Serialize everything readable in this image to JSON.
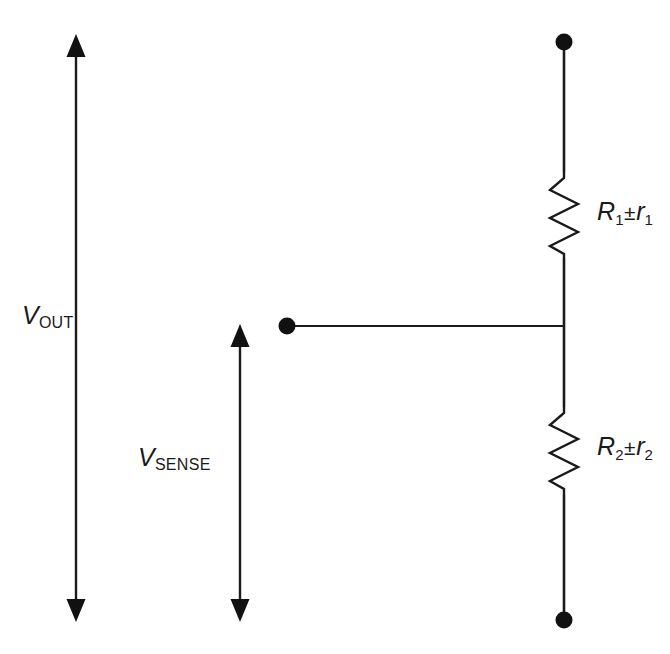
{
  "figure": {
    "kind": "electronic-schematic",
    "background_color": "#ffffff",
    "ink_color": "#1a1a1a",
    "width": 670,
    "height": 654
  },
  "labels": {
    "vout": {
      "symbol": "V",
      "subscript": "OUT",
      "full_text": "VOUT"
    },
    "vsense": {
      "symbol": "V",
      "subscript": "SENSE",
      "full_text": "VSENSE"
    },
    "r1": {
      "symbol": "R",
      "subscript": "1",
      "operator": "±",
      "tolerance_symbol": "r",
      "tolerance_subscript": "1",
      "full_text": "R1±r1"
    },
    "r2": {
      "symbol": "R",
      "subscript": "2",
      "operator": "±",
      "tolerance_symbol": "r",
      "tolerance_subscript": "2",
      "full_text": "R2±r2"
    }
  },
  "components": [
    {
      "id": "resistor-r1",
      "type": "resistor",
      "label": "R1±r1",
      "orientation": "vertical",
      "x": 564,
      "y_top": 172,
      "y_bottom": 258,
      "zigzag_half_width": 14,
      "zigzag_peaks": 6
    },
    {
      "id": "resistor-r2",
      "type": "resistor",
      "label": "R2±r2",
      "orientation": "vertical",
      "x": 564,
      "y_top": 407,
      "y_bottom": 495,
      "zigzag_half_width": 14,
      "zigzag_peaks": 6
    }
  ],
  "nodes": [
    {
      "id": "terminal-top",
      "type": "terminal-dot",
      "x": 564,
      "y": 42,
      "radius": 8.5
    },
    {
      "id": "terminal-mid-tap",
      "type": "terminal-dot",
      "x": 287,
      "y": 326,
      "radius": 8.5
    },
    {
      "id": "terminal-bottom",
      "type": "terminal-dot",
      "x": 564,
      "y": 620,
      "radius": 8.5
    }
  ],
  "wires": [
    {
      "id": "wire-top-to-r1",
      "x1": 564,
      "y1": 42,
      "x2": 564,
      "y2": 172
    },
    {
      "id": "wire-r1-to-junction",
      "x1": 564,
      "y1": 258,
      "x2": 564,
      "y2": 326
    },
    {
      "id": "wire-junction-to-r2",
      "x1": 564,
      "y1": 326,
      "x2": 564,
      "y2": 407
    },
    {
      "id": "wire-r2-to-bottom",
      "x1": 564,
      "y1": 495,
      "x2": 564,
      "y2": 620
    },
    {
      "id": "wire-mid-tap-horizontal",
      "x1": 287,
      "y1": 326,
      "x2": 564,
      "y2": 326
    }
  ],
  "dimension_arrows": [
    {
      "id": "arrow-vout",
      "label": "VOUT",
      "x": 76,
      "y_top": 37,
      "y_bottom": 620,
      "double_headed": true,
      "measures": "terminal-top to terminal-bottom"
    },
    {
      "id": "arrow-vsense",
      "label": "VSENSE",
      "x": 240,
      "y_top": 327,
      "y_bottom": 620,
      "double_headed": true,
      "measures": "mid-tap to terminal-bottom"
    }
  ]
}
